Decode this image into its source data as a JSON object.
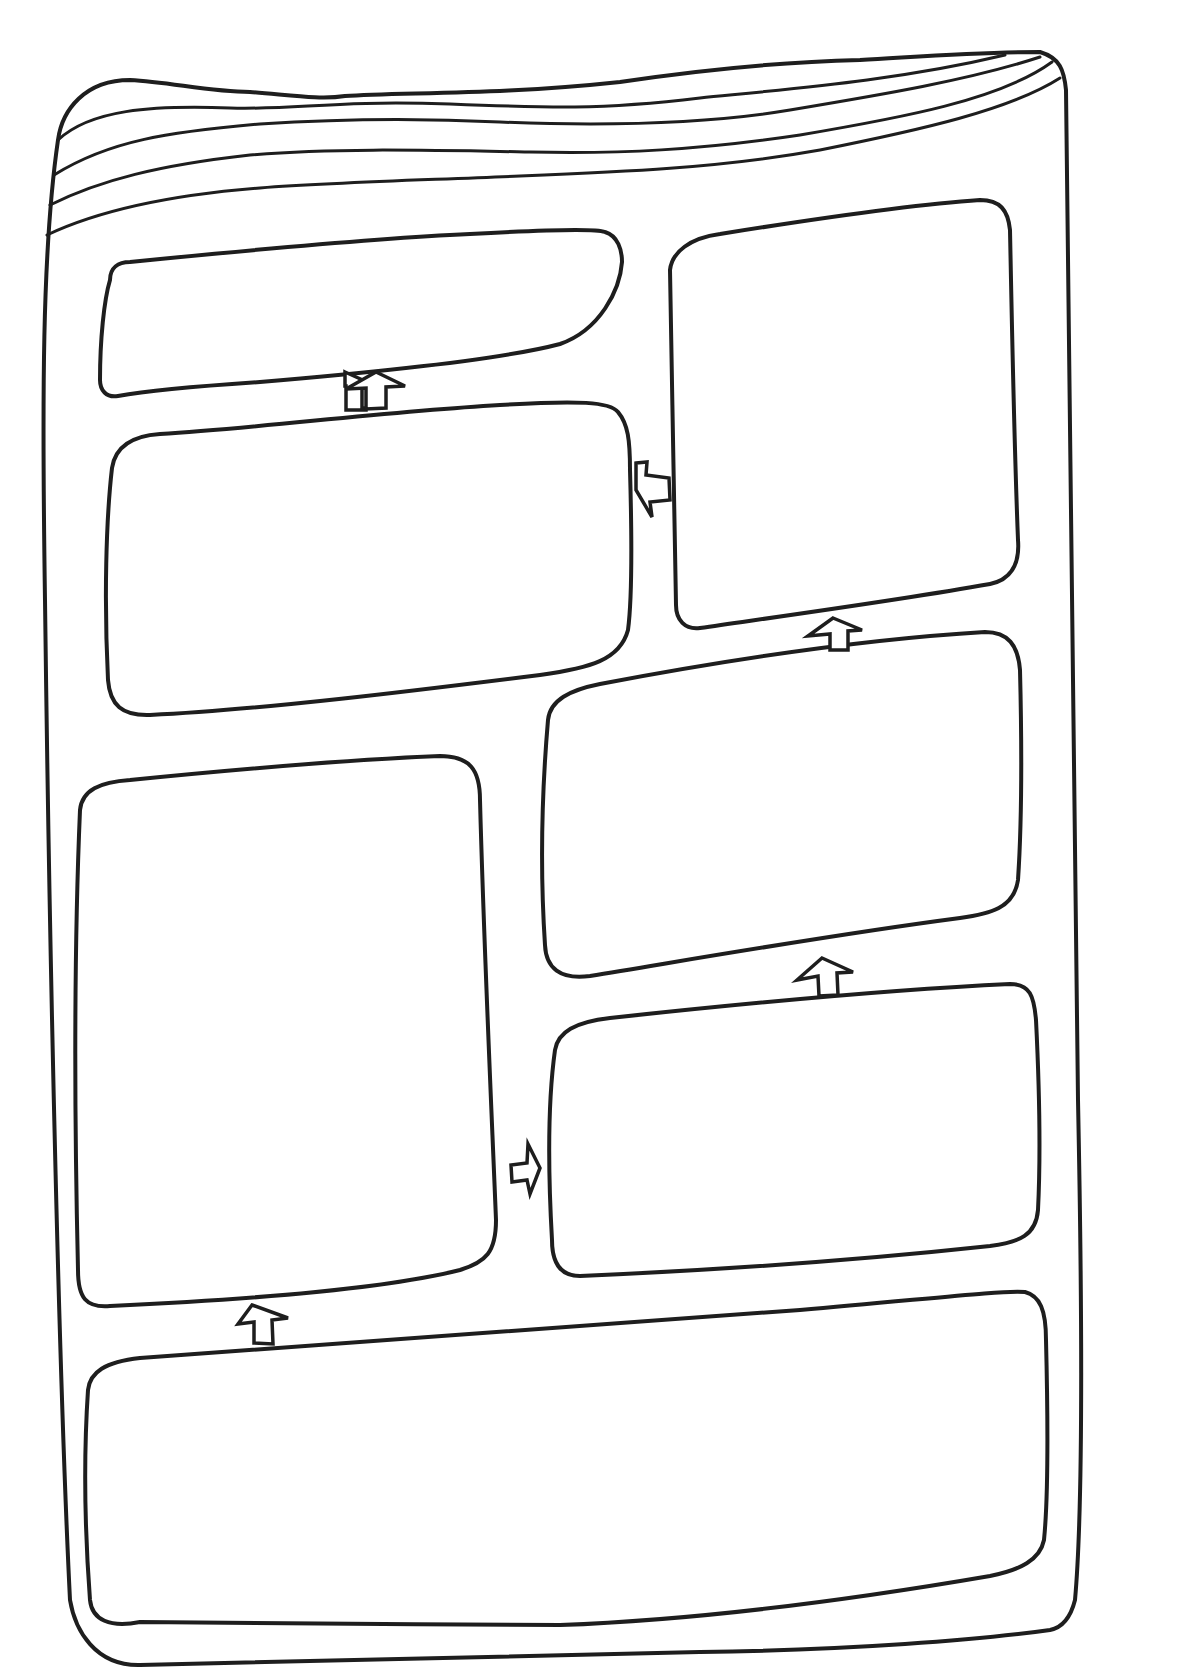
{
  "diagram": {
    "title": "",
    "style": "hand-drawn worksheet",
    "stroke_color": "#1e1e1e",
    "background_color": "#ffffff",
    "frame": {
      "shape": "book/page outline with curled top edge",
      "top_curl_lines": 5
    },
    "boxes": [
      {
        "id": "box-1",
        "position": "top-left",
        "label": ""
      },
      {
        "id": "box-2",
        "position": "upper-left",
        "label": ""
      },
      {
        "id": "box-3",
        "position": "top-right",
        "label": ""
      },
      {
        "id": "box-4",
        "position": "middle-right",
        "label": ""
      },
      {
        "id": "box-5",
        "position": "lower-left (tall)",
        "label": ""
      },
      {
        "id": "box-6",
        "position": "lower-right",
        "label": ""
      },
      {
        "id": "box-7",
        "position": "bottom (wide)",
        "label": ""
      }
    ],
    "arrows": [
      {
        "from": "box-7",
        "to": "box-5",
        "direction": "up"
      },
      {
        "from": "box-5",
        "to": "box-6",
        "direction": "right"
      },
      {
        "from": "box-6",
        "to": "box-4",
        "direction": "up"
      },
      {
        "from": "box-4",
        "to": "box-3",
        "direction": "up"
      },
      {
        "from": "box-3",
        "to": "box-2",
        "direction": "left"
      },
      {
        "from": "box-2",
        "to": "box-1",
        "direction": "up"
      }
    ]
  }
}
